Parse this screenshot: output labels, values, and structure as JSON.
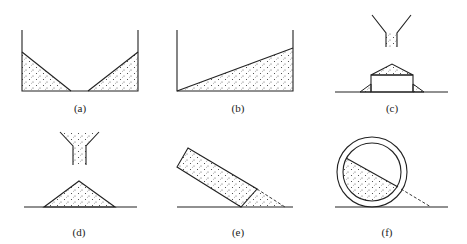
{
  "figure": {
    "panels": [
      {
        "id": "a",
        "label": "(a)",
        "description": "Container with granular material piled against both walls leaving an empty V-shaped gap at the bottom center"
      },
      {
        "id": "b",
        "label": "(b)",
        "description": "Container with granular material forming a single inclined slope from left bottom to right wall"
      },
      {
        "id": "c",
        "label": "(c)",
        "description": "Funnel pouring material onto a raised block forming a conical pile on top, with small piles at block sides"
      },
      {
        "id": "d",
        "label": "(d)",
        "description": "Funnel pouring material onto flat ground forming a conical pile"
      },
      {
        "id": "e",
        "label": "(e)",
        "description": "Tilted rectangular box of material resting on ground, with dashed slope showing outflow"
      },
      {
        "id": "f",
        "label": "(f)",
        "description": "Rotating drum (cylinder) partially filled with material showing inclined free surface, dashed tangent to ground"
      }
    ]
  }
}
